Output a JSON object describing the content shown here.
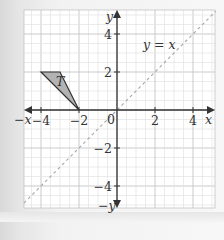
{
  "diagram": {
    "type": "coordinate-grid",
    "x_range": [
      -5,
      5.2
    ],
    "y_range": [
      -5.2,
      5.3
    ],
    "origin_px": [
      117,
      110
    ],
    "unit_px": 19,
    "axes": {
      "x_label": "x",
      "x_neg_label": "−x",
      "y_label": "y",
      "y_neg_label": "−y",
      "origin_label": "0",
      "x_ticks": [
        {
          "value": -4,
          "label": "−4"
        },
        {
          "value": -2,
          "label": "−2"
        },
        {
          "value": 2,
          "label": "2"
        },
        {
          "value": 4,
          "label": "4"
        }
      ],
      "y_ticks": [
        {
          "value": 4,
          "label": "4"
        },
        {
          "value": 2,
          "label": "2"
        },
        {
          "value": -2,
          "label": "−2"
        },
        {
          "value": -4,
          "label": "−4"
        }
      ]
    },
    "shapes": [
      {
        "name": "T",
        "label": "T",
        "vertices": [
          [
            -4,
            2
          ],
          [
            -3,
            2
          ],
          [
            -2,
            0
          ]
        ],
        "fill": "#b3b3b3",
        "stroke": "#333333"
      }
    ],
    "lines": [
      {
        "equation": "y = x",
        "label": "y = x",
        "style": "dashed",
        "color": "#a6a6a6",
        "from": [
          -4.9,
          -4.9
        ],
        "to": [
          5.2,
          5.2
        ]
      }
    ],
    "colors": {
      "grid_minor": "#e3e3e3",
      "grid_major": "#c4c4c4",
      "axis": "#333333",
      "panel": "#ffffff"
    }
  }
}
